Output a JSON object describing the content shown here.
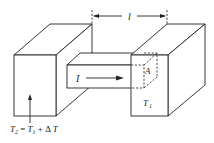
{
  "diagram": {
    "type": "thermal-conduction-bar",
    "labels": {
      "length": "l",
      "heat_flow": "I",
      "area": "A",
      "cold_temp_main": "T",
      "cold_temp_sub": "1",
      "hot_temp_eq": {
        "t2": "T",
        "t2_sub": "2",
        "equals": " = ",
        "t1": "T",
        "t1_sub": "1",
        "plus_delta": " + Δ ",
        "t": "T"
      }
    },
    "colors": {
      "stroke": "#222222",
      "background": "#ffffff"
    }
  }
}
